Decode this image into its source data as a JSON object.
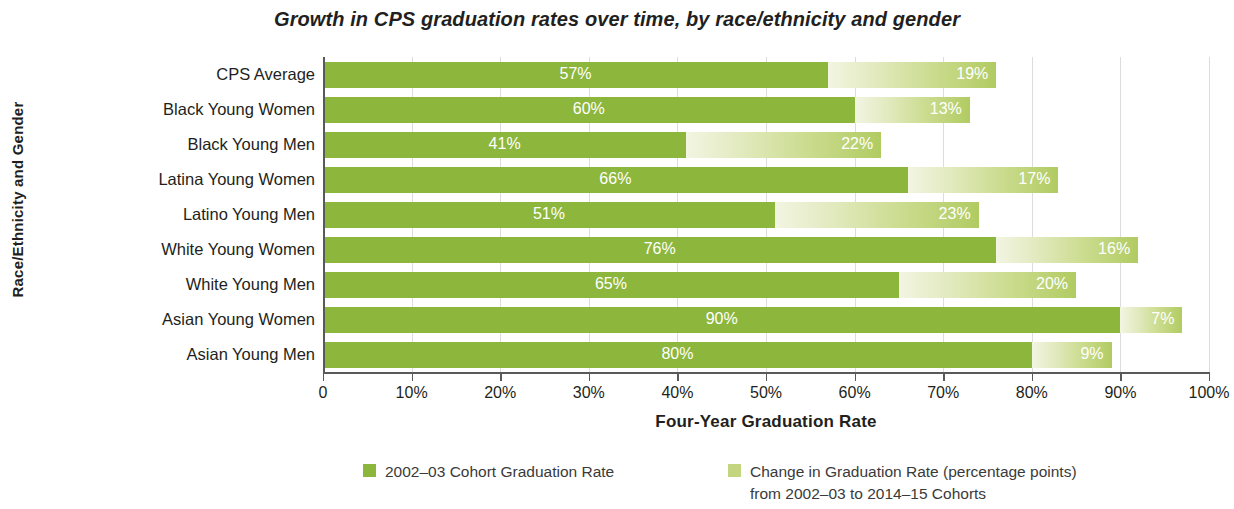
{
  "chart_data": {
    "type": "bar",
    "orientation": "horizontal",
    "stacked": true,
    "title": "Growth in CPS graduation rates over time, by race/ethnicity and gender",
    "xlabel": "Four-Year Graduation Rate",
    "ylabel": "Race/Ethnicity and Gender",
    "xlim": [
      0,
      100
    ],
    "grid": true,
    "legend_position": "bottom",
    "xticks": [
      "0",
      "10%",
      "20%",
      "30%",
      "40%",
      "50%",
      "60%",
      "70%",
      "80%",
      "90%",
      "100%"
    ],
    "xtick_values": [
      0,
      10,
      20,
      30,
      40,
      50,
      60,
      70,
      80,
      90,
      100
    ],
    "categories": [
      "CPS Average",
      "Black Young Women",
      "Black Young Men",
      "Latina Young Women",
      "Latino Young Men",
      "White Young Women",
      "White Young Men",
      "Asian Young Women",
      "Asian Young Men"
    ],
    "series": [
      {
        "name": "2002–03 Cohort Graduation Rate",
        "color": "#8db63c",
        "values": [
          57,
          60,
          41,
          66,
          51,
          76,
          65,
          90,
          80
        ],
        "labels": [
          "57%",
          "60%",
          "41%",
          "66%",
          "51%",
          "76%",
          "65%",
          "90%",
          "80%"
        ]
      },
      {
        "name": "Change in Graduation Rate (percentage points) from 2002–03 to 2014–15 Cohorts",
        "color": "#c3d67f",
        "values": [
          19,
          13,
          22,
          17,
          23,
          16,
          20,
          7,
          9
        ],
        "labels": [
          "19%",
          "13%",
          "22%",
          "17%",
          "23%",
          "16%",
          "20%",
          "7%",
          "9%"
        ]
      }
    ]
  },
  "legend": {
    "items": [
      {
        "label": "2002–03 Cohort Graduation Rate",
        "label_line2": ""
      },
      {
        "label": "Change in Graduation Rate (percentage points)",
        "label_line2": "from 2002–03 to 2014–15 Cohorts"
      }
    ]
  },
  "colors": {
    "base": "#8db63c",
    "change_light": "#f2f5e2",
    "change_dark": "#b1cb62",
    "axis": "#58595b",
    "grid": "#dcdcdc",
    "text": "#231f20"
  }
}
